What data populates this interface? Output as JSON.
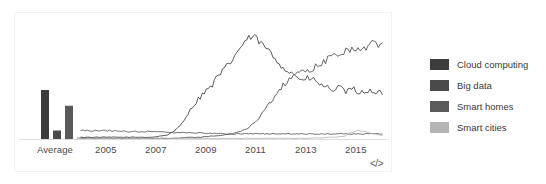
{
  "chart_data": {
    "type": "line",
    "title": "",
    "xlabel": "",
    "ylabel": "",
    "grid": false,
    "legend_position": "right",
    "ylim": [
      0,
      100
    ],
    "xlim": [
      2004,
      2016.8
    ],
    "average_group_label": "Average",
    "x_tick_labels": [
      "2005",
      "2007",
      "2009",
      "2011",
      "2013",
      "2015"
    ],
    "x_tick_values": [
      2005,
      2007,
      2009,
      2011,
      2013,
      2015
    ],
    "average_bars": [
      {
        "name": "Cloud computing",
        "value": 44
      },
      {
        "name": "Big data",
        "value": 8
      },
      {
        "name": "Smart homes",
        "value": 30
      },
      {
        "name": "Smart cities",
        "value": 2
      }
    ],
    "series": [
      {
        "name": "Cloud computing",
        "color": "#3c3c3c",
        "x": [
          2004.0,
          2004.3,
          2004.6,
          2004.9,
          2005.2,
          2005.5,
          2005.8,
          2006.1,
          2006.4,
          2006.7,
          2007.0,
          2007.3,
          2007.6,
          2007.9,
          2008.2,
          2008.5,
          2008.8,
          2009.1,
          2009.4,
          2009.7,
          2010.0,
          2010.3,
          2010.6,
          2010.9,
          2011.2,
          2011.5,
          2011.8,
          2012.1,
          2012.4,
          2012.7,
          2013.0,
          2013.3,
          2013.6,
          2013.9,
          2014.2,
          2014.5,
          2014.8,
          2015.1,
          2015.4,
          2015.7,
          2016.0,
          2016.3,
          2016.6
        ],
        "y": [
          2,
          2,
          2,
          2,
          2,
          2,
          2,
          2,
          2,
          2,
          2,
          3,
          4,
          7,
          14,
          24,
          33,
          41,
          46,
          55,
          62,
          70,
          80,
          88,
          92,
          86,
          80,
          72,
          66,
          60,
          57,
          52,
          55,
          50,
          47,
          44,
          46,
          42,
          45,
          41,
          44,
          40,
          42
        ]
      },
      {
        "name": "Big data",
        "color": "#4a4a4a",
        "x": [
          2004.0,
          2004.5,
          2005.0,
          2005.5,
          2006.0,
          2006.5,
          2007.0,
          2007.5,
          2008.0,
          2008.5,
          2009.0,
          2009.5,
          2010.0,
          2010.5,
          2011.0,
          2011.4,
          2011.8,
          2012.2,
          2012.6,
          2013.0,
          2013.4,
          2013.8,
          2014.2,
          2014.6,
          2015.0,
          2015.4,
          2015.8,
          2016.2,
          2016.6
        ],
        "y": [
          1,
          1,
          1,
          1,
          1,
          1,
          1,
          1,
          1,
          2,
          2,
          3,
          4,
          6,
          10,
          18,
          30,
          42,
          52,
          57,
          60,
          64,
          70,
          74,
          78,
          82,
          80,
          86,
          83
        ]
      },
      {
        "name": "Smart homes",
        "color": "#5a5a5a",
        "x": [
          2004.0,
          2005.0,
          2006.0,
          2007.0,
          2008.0,
          2009.0,
          2010.0,
          2011.0,
          2012.0,
          2013.0,
          2014.0,
          2015.0,
          2016.0,
          2016.6
        ],
        "y": [
          8,
          8,
          7,
          7,
          6,
          6,
          5,
          5,
          5,
          5,
          5,
          5,
          5,
          5
        ]
      },
      {
        "name": "Smart cities",
        "color": "#b4b4b4",
        "x": [
          2004.0,
          2006.0,
          2008.0,
          2010.0,
          2012.0,
          2013.5,
          2014.5,
          2015.0,
          2015.3,
          2015.6,
          2015.9,
          2016.2,
          2016.6
        ],
        "y": [
          1,
          1,
          1,
          1,
          1,
          1,
          2,
          3,
          6,
          8,
          7,
          5,
          4
        ]
      }
    ]
  },
  "legend": {
    "items": [
      {
        "label": "Cloud computing",
        "color": "#3c3c3c"
      },
      {
        "label": "Big data",
        "color": "#4a4a4a"
      },
      {
        "label": "Smart homes",
        "color": "#5a5a5a"
      },
      {
        "label": "Smart cities",
        "color": "#b4b4b4"
      }
    ]
  },
  "embed": {
    "icon_label": "</>"
  }
}
